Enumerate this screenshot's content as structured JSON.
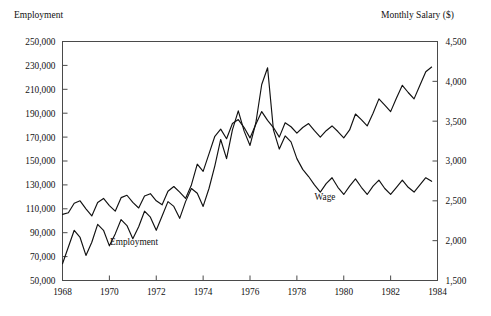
{
  "chart_data": {
    "type": "line",
    "title": "",
    "xlabel": "",
    "ylabel": "Employment",
    "y2label": "Monthly Salary ($)",
    "grid": false,
    "legend_position": "inline-annotation",
    "xlim": [
      1968.0,
      1984.0
    ],
    "ylim": [
      50000,
      250000
    ],
    "y2lim": [
      1500,
      4500
    ],
    "x_tick_labels": [
      "1968",
      "1970",
      "1972",
      "1974",
      "1976",
      "1978",
      "1980",
      "1982",
      "1984"
    ],
    "x_ticks": [
      1968,
      1970,
      1972,
      1974,
      1976,
      1978,
      1980,
      1982,
      1984
    ],
    "y_tick_labels": [
      "50,000",
      "70,000",
      "90,000",
      "110,000",
      "130,000",
      "150,000",
      "170,000",
      "190,000",
      "210,000",
      "230,000",
      "250,000"
    ],
    "y_ticks": [
      50000,
      70000,
      90000,
      110000,
      130000,
      150000,
      170000,
      190000,
      210000,
      230000,
      250000
    ],
    "y2_tick_labels": [
      "1,500",
      "2,000",
      "2,500",
      "3,000",
      "3,500",
      "4,000",
      "4,500"
    ],
    "y2_ticks": [
      1500,
      2000,
      2500,
      3000,
      3500,
      4000,
      4500
    ],
    "annotations": [
      {
        "text": "Employment",
        "x": 1971.05,
        "y": 80000
      },
      {
        "text": "Wage",
        "x": 1979.2,
        "y": 117000
      }
    ],
    "series": [
      {
        "name": "Employment",
        "axis": "left",
        "color": "#111111",
        "x": [
          1968.0,
          1968.25,
          1968.5,
          1968.75,
          1969.0,
          1969.25,
          1969.5,
          1969.75,
          1970.0,
          1970.25,
          1970.5,
          1970.75,
          1971.0,
          1971.25,
          1971.5,
          1971.75,
          1972.0,
          1972.25,
          1972.5,
          1972.75,
          1973.0,
          1973.25,
          1973.5,
          1973.75,
          1974.0,
          1974.25,
          1974.5,
          1974.75,
          1975.0,
          1975.25,
          1975.5,
          1975.75,
          1976.0,
          1976.25,
          1976.5,
          1976.75,
          1977.0,
          1977.25,
          1977.5,
          1977.75,
          1978.0,
          1978.25,
          1978.5,
          1978.75,
          1979.0,
          1979.25,
          1979.5,
          1979.75,
          1980.0,
          1980.25,
          1980.5,
          1980.75,
          1981.0,
          1981.25,
          1981.5,
          1981.75,
          1982.0,
          1982.25,
          1982.5,
          1982.75,
          1983.0,
          1983.25,
          1983.5,
          1983.75
        ],
        "y": [
          64000,
          78000,
          92000,
          86000,
          71000,
          82000,
          97000,
          92000,
          79000,
          89000,
          101000,
          96000,
          85000,
          95000,
          108000,
          103000,
          92000,
          104000,
          116000,
          112000,
          102000,
          116000,
          127000,
          123000,
          112000,
          127000,
          146000,
          168000,
          152000,
          176000,
          192000,
          175000,
          163000,
          182000,
          214000,
          228000,
          176000,
          160000,
          171000,
          166000,
          152000,
          143000,
          137000,
          130000,
          124000,
          131000,
          136000,
          128000,
          122000,
          129000,
          135000,
          128000,
          122000,
          129000,
          134000,
          127000,
          122000,
          128000,
          134000,
          128000,
          124000,
          130000,
          136000,
          133000
        ]
      },
      {
        "name": "Wage",
        "axis": "right",
        "color": "#111111",
        "x": [
          1968.0,
          1968.25,
          1968.5,
          1968.75,
          1969.0,
          1969.25,
          1969.5,
          1969.75,
          1970.0,
          1970.25,
          1970.5,
          1970.75,
          1971.0,
          1971.25,
          1971.5,
          1971.75,
          1972.0,
          1972.25,
          1972.5,
          1972.75,
          1973.0,
          1973.25,
          1973.5,
          1973.75,
          1974.0,
          1974.25,
          1974.5,
          1974.75,
          1975.0,
          1975.25,
          1975.5,
          1975.75,
          1976.0,
          1976.25,
          1976.5,
          1976.75,
          1977.0,
          1977.25,
          1977.5,
          1977.75,
          1978.0,
          1978.25,
          1978.5,
          1978.75,
          1979.0,
          1979.25,
          1979.5,
          1979.75,
          1980.0,
          1980.25,
          1980.5,
          1980.75,
          1981.0,
          1981.25,
          1981.5,
          1981.75,
          1982.0,
          1982.25,
          1982.5,
          1982.75,
          1983.0,
          1983.25,
          1983.5,
          1983.75
        ],
        "y2": [
          2330,
          2350,
          2470,
          2500,
          2400,
          2310,
          2480,
          2530,
          2440,
          2370,
          2540,
          2570,
          2480,
          2410,
          2560,
          2590,
          2500,
          2450,
          2620,
          2680,
          2610,
          2530,
          2700,
          2960,
          2870,
          3090,
          3310,
          3400,
          3280,
          3470,
          3520,
          3420,
          3290,
          3460,
          3620,
          3510,
          3420,
          3300,
          3480,
          3430,
          3350,
          3420,
          3470,
          3380,
          3300,
          3380,
          3440,
          3370,
          3290,
          3390,
          3590,
          3520,
          3440,
          3600,
          3780,
          3700,
          3620,
          3790,
          3950,
          3860,
          3780,
          3950,
          4120,
          4180
        ]
      }
    ]
  }
}
